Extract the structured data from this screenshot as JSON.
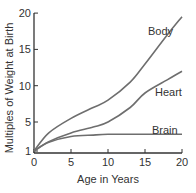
{
  "chart_data": {
    "type": "line",
    "title": "",
    "xlabel": "Age in Years",
    "ylabel": "Multiples of Weight at Birth",
    "xlim": [
      0,
      20
    ],
    "ylim": [
      1,
      20
    ],
    "grid": false,
    "legend_position": "inline labels",
    "x_ticks": [
      "0",
      "5",
      "10",
      "15",
      "20"
    ],
    "y_ticks": [
      "1",
      "5",
      "10",
      "15",
      "20"
    ],
    "x": [
      0,
      2,
      5,
      8,
      10,
      13,
      15,
      18,
      20
    ],
    "series": [
      {
        "name": "Body",
        "values": [
          1,
          3.5,
          5.5,
          7,
          8,
          10.5,
          13,
          17,
          19.5
        ]
      },
      {
        "name": "Heart",
        "values": [
          1,
          2.3,
          3.5,
          4.3,
          5,
          7,
          9,
          10.8,
          12
        ]
      },
      {
        "name": "Brain",
        "values": [
          1,
          2.2,
          3.0,
          3.2,
          3.3,
          3.3,
          3.3,
          3.3,
          3.3
        ]
      }
    ],
    "colors": {
      "line": "#6e6e6e",
      "axis": "#333333",
      "text": "#333333"
    }
  }
}
